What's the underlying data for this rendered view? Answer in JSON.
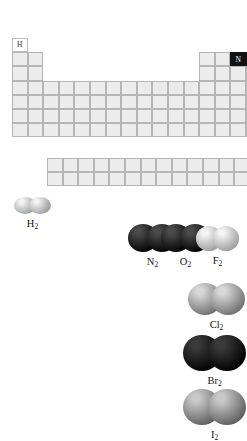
{
  "figure": {
    "background_color": "#ffffff"
  },
  "periodic_table": {
    "grid": {
      "cell_width": 15.6,
      "cell_height": 14.2,
      "origin_x": 12,
      "origin_y": 38,
      "main_rows": 7,
      "main_columns": 18,
      "fblock_rows": 2,
      "fblock_columns": 14,
      "fblock_origin_x": 47,
      "fblock_origin_y": 158
    },
    "colors": {
      "cell_fill": "#ececec",
      "cell_border": "#b6b6b6",
      "blank_fill": "#ffffff",
      "dark_fill": "#121212",
      "gray_fill": "#a9a9a9"
    },
    "highlighted_cells": [
      {
        "symbol": "H",
        "period": 1,
        "group": 1,
        "style": "blank"
      },
      {
        "symbol": "N",
        "period": 2,
        "group": 15,
        "style": "dark"
      },
      {
        "symbol": "O",
        "period": 2,
        "group": 16,
        "style": "dark"
      },
      {
        "symbol": "F",
        "period": 2,
        "group": 17,
        "style": "gray"
      },
      {
        "symbol": "Cl",
        "period": 3,
        "group": 17,
        "style": "gray"
      },
      {
        "symbol": "Br",
        "period": 4,
        "group": 17,
        "style": "dark"
      },
      {
        "symbol": "I",
        "period": 5,
        "group": 17,
        "style": "gray"
      }
    ]
  },
  "molecules": [
    {
      "id": "h2",
      "label": "H",
      "subscript": "2",
      "atom_color_light": "#f2f2f2",
      "atom_color_dark": "#9a9a9a",
      "x": 14,
      "y": 197,
      "atom_radius": 11,
      "overlap": 7,
      "squash": 0.78
    },
    {
      "id": "n2",
      "label": "N",
      "subscript": "2",
      "atom_color_light": "#4a4a4a",
      "atom_color_dark": "#000000",
      "x": 128,
      "y": 224,
      "atom_radius": 15,
      "overlap": 11,
      "squash": 0.92
    },
    {
      "id": "o2",
      "label": "O",
      "subscript": "2",
      "atom_color_light": "#4a4a4a",
      "atom_color_dark": "#000000",
      "x": 161,
      "y": 224,
      "atom_radius": 15,
      "overlap": 11,
      "squash": 0.92
    },
    {
      "id": "f2",
      "label": "F",
      "subscript": "2",
      "atom_color_light": "#f4f4f4",
      "atom_color_dark": "#9d9d9d",
      "x": 196,
      "y": 226,
      "atom_radius": 13,
      "overlap": 9,
      "squash": 0.95
    },
    {
      "id": "cl2",
      "label": "Cl",
      "subscript": "2",
      "atom_color_light": "#d8d8d8",
      "atom_color_dark": "#6f6f6f",
      "x": 188,
      "y": 283,
      "atom_radius": 17,
      "overlap": 11,
      "squash": 0.95
    },
    {
      "id": "br2",
      "label": "Br",
      "subscript": "2",
      "atom_color_light": "#3a3a3a",
      "atom_color_dark": "#000000",
      "x": 183,
      "y": 335,
      "atom_radius": 19,
      "overlap": 13,
      "squash": 0.95
    },
    {
      "id": "i2",
      "label": "I",
      "subscript": "2",
      "atom_color_light": "#c9c9c9",
      "atom_color_dark": "#5e5e5e",
      "x": 183,
      "y": 389,
      "atom_radius": 19,
      "overlap": 13,
      "squash": 0.95
    }
  ]
}
